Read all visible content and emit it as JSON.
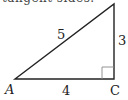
{
  "header": {
    "cut_text": "tangent sides."
  },
  "diagram": {
    "type": "right-triangle",
    "vertices": {
      "A": {
        "label": "A"
      },
      "B": {
        "label": ""
      },
      "C": {
        "label": "C"
      }
    },
    "sides": {
      "hypotenuse": "5",
      "vertical": "3",
      "base": "4"
    },
    "right_angle_at": "C",
    "stroke_color": "#222222"
  }
}
